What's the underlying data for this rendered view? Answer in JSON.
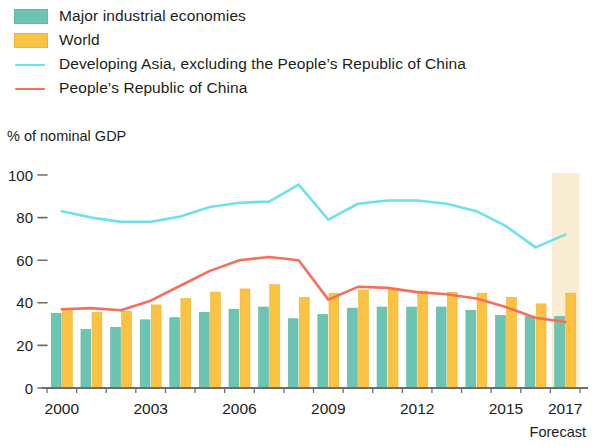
{
  "legend": {
    "items": [
      {
        "label": "Major industrial economies",
        "marker": "swatch",
        "color": "#6BC5B2",
        "icon": "legend-swatch-icon"
      },
      {
        "label": "World",
        "marker": "swatch",
        "color": "#FBC341",
        "icon": "legend-swatch-icon"
      },
      {
        "label": "Developing Asia, excluding the People’s Republic of China",
        "marker": "line",
        "color": "#6FE0EE",
        "icon": "legend-line-icon"
      },
      {
        "label": "People’s Republic of China",
        "marker": "line",
        "color": "#F4705C",
        "icon": "legend-line-icon"
      }
    ]
  },
  "annotations": {
    "forecast_note": "Forecast",
    "forecast_band_color": "#F8EDD2",
    "forecast_band_start_year": 2017,
    "forecast_band_end_year": 2017
  },
  "chart_data": {
    "type": "bar",
    "title": "",
    "subtitle": "",
    "xlabel": "",
    "ylabel": "% of nominal GDP",
    "ylim": [
      0,
      100
    ],
    "yticks": [
      0,
      20,
      40,
      60,
      80,
      100
    ],
    "ytick_labels": [
      "0",
      "20",
      "40",
      "60",
      "80",
      "100"
    ],
    "grid": false,
    "legend_position": "top-left",
    "categories": [
      "2000",
      "2001",
      "2002",
      "2003",
      "2004",
      "2005",
      "2006",
      "2007",
      "2008",
      "2009",
      "2010",
      "2011",
      "2012",
      "2013",
      "2014",
      "2015",
      "2016",
      "2017"
    ],
    "xtick_labels": [
      "2000",
      "2003",
      "2006",
      "2009",
      "2012",
      "2015",
      "2017"
    ],
    "xtick_categories": [
      "2000",
      "2003",
      "2006",
      "2009",
      "2012",
      "2015",
      "2017"
    ],
    "series": [
      {
        "name": "Major industrial economies",
        "type": "bar",
        "color": "#6BC5B2",
        "values": [
          35,
          27.5,
          28.5,
          32,
          33,
          35.5,
          37,
          38,
          32.5,
          34.5,
          37.5,
          38,
          38,
          38,
          36.5,
          34,
          33.5,
          33.5
        ]
      },
      {
        "name": "World",
        "type": "bar",
        "color": "#FBC341",
        "values": [
          36.5,
          35.5,
          36,
          39,
          42,
          45,
          46.5,
          48.5,
          42.5,
          44.5,
          46,
          46.5,
          45.5,
          45,
          44.5,
          42.5,
          39.5,
          44.5
        ]
      },
      {
        "name": "Developing Asia, excluding the People’s Republic of China",
        "type": "line",
        "color": "#6FE0EE",
        "values": [
          83,
          80,
          78,
          78,
          80.5,
          85,
          87,
          87.5,
          95.5,
          79,
          86.5,
          88,
          88,
          86.5,
          83,
          76,
          66,
          72
        ]
      },
      {
        "name": "People’s Republic of China",
        "type": "line",
        "color": "#F4705C",
        "values": [
          37,
          37.5,
          36.5,
          41,
          48,
          55,
          60,
          61.5,
          60,
          41.5,
          47.5,
          47,
          45,
          44,
          42,
          38,
          33,
          31
        ]
      }
    ]
  }
}
